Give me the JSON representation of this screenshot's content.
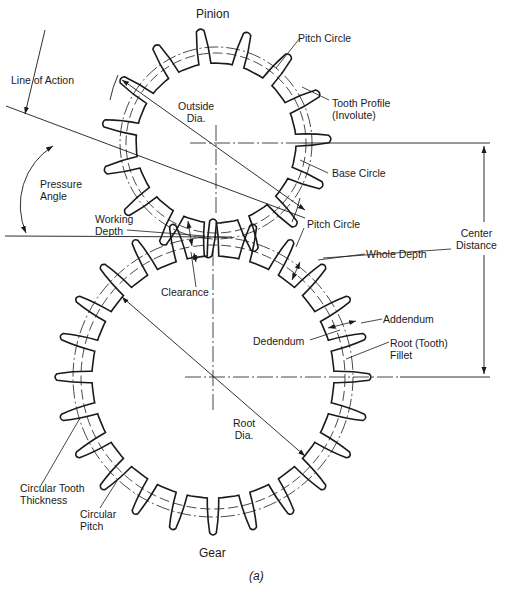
{
  "figure": {
    "title_top": "Pinion",
    "title_bottom": "Gear",
    "caption": "(a)",
    "caption_letter": "a"
  },
  "labels": {
    "pitch_circle_pinion": "Pitch Circle",
    "tooth_profile": "Tooth Profile\n(Involute)",
    "outside_dia": "Outside\nDia.",
    "base_circle": "Base Circle",
    "line_of_action": "Line of Action",
    "pressure_angle": "Pressure\nAngle",
    "working_depth": "Working\nDepth",
    "pitch_circle_gear": "Pitch Circle",
    "whole_depth": "Whole Depth",
    "center_distance": "Center\nDistance",
    "clearance": "Clearance",
    "addendum": "Addendum",
    "dedendum": "Dedendum",
    "root_fillet": "Root (Tooth)\nFillet",
    "root_dia": "Root\nDia.",
    "circular_tooth_thickness": "Circular Tooth\nThickness",
    "circular_pitch": "Circular\nPitch"
  },
  "geometry": {
    "pinion": {
      "cx": 216,
      "cy": 143,
      "teeth": 15,
      "r_outer": 113,
      "r_pitch": 96,
      "r_base": 90,
      "r_root": 80,
      "phase_deg": -2
    },
    "gear": {
      "cx": 213,
      "cy": 377,
      "teeth": 24,
      "r_outer": 156,
      "r_pitch": 140,
      "r_base": 132,
      "r_root": 121,
      "phase_deg": 0
    },
    "pressure_angle_deg": 20,
    "stroke_color": "#1a1a1a"
  }
}
